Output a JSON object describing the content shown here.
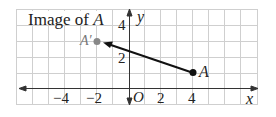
{
  "title": "Image of A",
  "title_prefix": "Image of ",
  "title_var": "A",
  "axes": {
    "x_label": "x",
    "y_label": "y",
    "origin_label": "O",
    "x_ticks": [
      "−4",
      "−2",
      "2",
      "4"
    ],
    "y_ticks": [
      "4",
      "2"
    ]
  },
  "points": {
    "A": {
      "label": "A",
      "x": 4,
      "y": 1,
      "color": "#111111"
    },
    "A_prime": {
      "label": "A′",
      "x": -2,
      "y": 3,
      "color": "#888888"
    }
  },
  "arrow": {
    "from": "A",
    "to": "A_prime"
  },
  "colors": {
    "grid": "#c8c8c8",
    "axis": "#333333"
  }
}
